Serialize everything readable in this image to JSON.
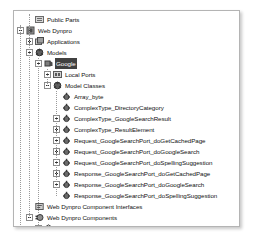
{
  "window": {
    "name": "project-explorer-tree",
    "background_color": "#ffffff",
    "panel_border_color": "#b4b4b4",
    "selection_color": "#414141",
    "selection_text_color": "#ffffff"
  },
  "tree": {
    "nodes": [
      {
        "label": "Public Parts",
        "depth": 2,
        "expander": "none",
        "icon": "public-parts-icon",
        "selected": false
      },
      {
        "label": "Web Dynpro",
        "depth": 1,
        "expander": "minus",
        "icon": "web-dynpro-icon",
        "selected": false
      },
      {
        "label": "Applications",
        "depth": 2,
        "expander": "plus",
        "icon": "applications-icon",
        "selected": false
      },
      {
        "label": "Models",
        "depth": 2,
        "expander": "minus",
        "icon": "models-icon",
        "selected": false
      },
      {
        "label": "Google",
        "depth": 3,
        "expander": "minus",
        "icon": "model-icon",
        "selected": true
      },
      {
        "label": "Local Ports",
        "depth": 4,
        "expander": "plus",
        "icon": "local-ports-icon",
        "selected": false
      },
      {
        "label": "Model Classes",
        "depth": 4,
        "expander": "minus",
        "icon": "model-classes-icon",
        "selected": false
      },
      {
        "label": "Array_byte",
        "depth": 5,
        "expander": "none",
        "icon": "class-icon",
        "selected": false
      },
      {
        "label": "ComplexType_DirectoryCategory",
        "depth": 5,
        "expander": "none",
        "icon": "class-icon",
        "selected": false
      },
      {
        "label": "ComplexType_GoogleSearchResult",
        "depth": 5,
        "expander": "plus",
        "icon": "class-icon",
        "selected": false
      },
      {
        "label": "ComplexType_ResultElement",
        "depth": 5,
        "expander": "plus",
        "icon": "class-icon",
        "selected": false
      },
      {
        "label": "Request_GoogleSearchPort_doGetCachedPage",
        "depth": 5,
        "expander": "plus",
        "icon": "class-icon",
        "selected": false
      },
      {
        "label": "Request_GoogleSearchPort_doGoogleSearch",
        "depth": 5,
        "expander": "plus",
        "icon": "class-icon",
        "selected": false
      },
      {
        "label": "Request_GoogleSearchPort_doSpellingSuggestion",
        "depth": 5,
        "expander": "plus",
        "icon": "class-icon",
        "selected": false
      },
      {
        "label": "Response_GoogleSearchPort_doGetCachedPage",
        "depth": 5,
        "expander": "plus",
        "icon": "class-icon",
        "selected": false
      },
      {
        "label": "Response_GoogleSearchPort_doGoogleSearch",
        "depth": 5,
        "expander": "plus",
        "icon": "class-icon",
        "selected": false
      },
      {
        "label": "Response_GoogleSearchPort_doSpellingSuggestion",
        "depth": 5,
        "expander": "none",
        "icon": "class-icon",
        "selected": false
      },
      {
        "label": "Web Dynpro Component Interfaces",
        "depth": 2,
        "expander": "none",
        "icon": "component-interfaces-icon",
        "selected": false
      },
      {
        "label": "Web Dynpro Components",
        "depth": 2,
        "expander": "minus",
        "icon": "components-icon",
        "selected": false
      },
      {
        "label": "GoogleSearchComp",
        "depth": 3,
        "expander": "plus",
        "icon": "component-icon",
        "selected": false
      },
      {
        "label": "Dictionaries",
        "depth": 1,
        "expander": "plus",
        "icon": "dictionaries-icon",
        "selected": false
      },
      {
        "label": "src",
        "depth": 1,
        "expander": "plus",
        "icon": "folder-icon",
        "selected": false
      }
    ]
  }
}
